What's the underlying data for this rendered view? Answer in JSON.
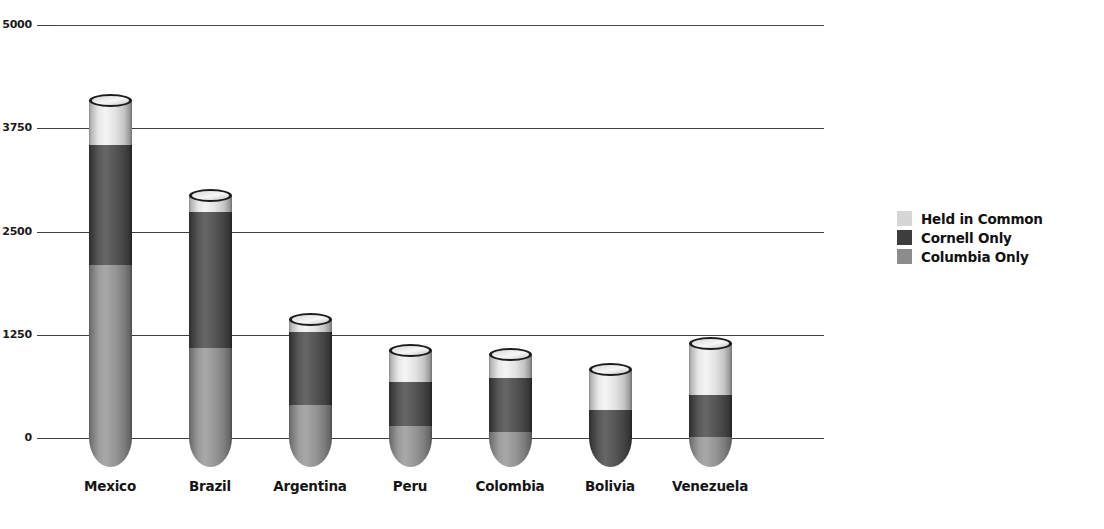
{
  "chart_data": {
    "type": "bar",
    "stacked": true,
    "title": "",
    "subtitle": "",
    "xlabel": "",
    "ylabel": "",
    "categories": [
      "Mexico",
      "Brazil",
      "Argentina",
      "Peru",
      "Colombia",
      "Bolivia",
      "Venezuela"
    ],
    "series": [
      {
        "name": "Held in Common",
        "color": "#d6d6d6",
        "values": [
          545,
          195,
          145,
          385,
          275,
          485,
          630
        ]
      },
      {
        "name": "Cornell Only",
        "color": "#3d3d3d",
        "values": [
          1450,
          1645,
          885,
          535,
          655,
          340,
          505
        ]
      },
      {
        "name": "Columbia Only",
        "color": "#8c8c8c",
        "values": [
          2095,
          1090,
          400,
          145,
          75,
          0,
          15
        ]
      }
    ],
    "totals": [
      4090,
      2930,
      1430,
      1065,
      1005,
      825,
      1150
    ],
    "ytick_labels": [
      "0",
      "1250",
      "2500",
      "3750",
      "5000"
    ],
    "ytick_values": [
      0,
      1250,
      2500,
      3750,
      5000
    ],
    "ylim": [
      0,
      5000
    ],
    "grid": true,
    "legend_position": "right"
  },
  "legend": {
    "entries": [
      {
        "label": "Held in Common",
        "swatch_class": "sw-common"
      },
      {
        "label": "Cornell Only",
        "swatch_class": "sw-cornell"
      },
      {
        "label": "Columbia Only",
        "swatch_class": "sw-columbia"
      }
    ]
  },
  "colors": {
    "held_in_common": "#d6d6d6",
    "cornell_only": "#3d3d3d",
    "columbia_only": "#8c8c8c",
    "gridline": "#3f3f3f",
    "background": "#ffffff",
    "text": "#111111"
  }
}
